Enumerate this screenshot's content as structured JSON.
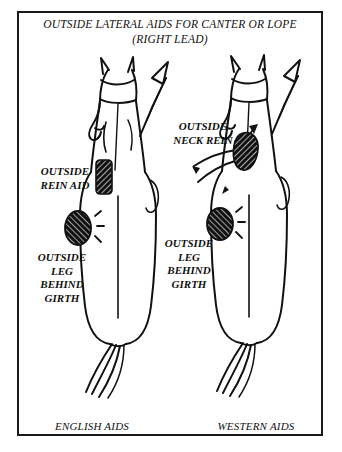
{
  "figure": {
    "title_line1": "OUTSIDE LATERAL AIDS FOR CANTER OR LOPE",
    "title_line2": "(RIGHT LEAD)",
    "border_color": "#1a1a1a",
    "background_color": "#ffffff",
    "ink_color": "#111111"
  },
  "panels": [
    {
      "id": "english",
      "caption": "ENGLISH AIDS",
      "labels": [
        {
          "id": "rein-aid",
          "text": "OUTSIDE\nREIN AID"
        },
        {
          "id": "leg-behind-girth",
          "text": "OUTSIDE\nLEG\nBEHIND\nGIRTH"
        }
      ],
      "markers": [
        {
          "id": "rein-hand-marker",
          "kind": "hatched-rectangle"
        },
        {
          "id": "leg-contact-marker",
          "kind": "hatched-oval-with-impact-lines"
        }
      ],
      "direction_arrow": "up-right"
    },
    {
      "id": "western",
      "caption": "WESTERN AIDS",
      "labels": [
        {
          "id": "neck-rein",
          "text": "OUTSIDE\nNECK REIN"
        },
        {
          "id": "leg-behind-girth",
          "text": "OUTSIDE\nLEG\nBEHIND\nGIRTH"
        }
      ],
      "markers": [
        {
          "id": "rein-hand-marker",
          "kind": "hatched-blob"
        },
        {
          "id": "leg-contact-marker",
          "kind": "hatched-oval-with-impact-lines"
        }
      ],
      "direction_arrow": "up-right"
    }
  ],
  "icons": {
    "horse_top_view": "horse-overhead-icon",
    "direction_arrow": "arrow-up-right-icon",
    "contact_marker": "contact-point-icon"
  }
}
